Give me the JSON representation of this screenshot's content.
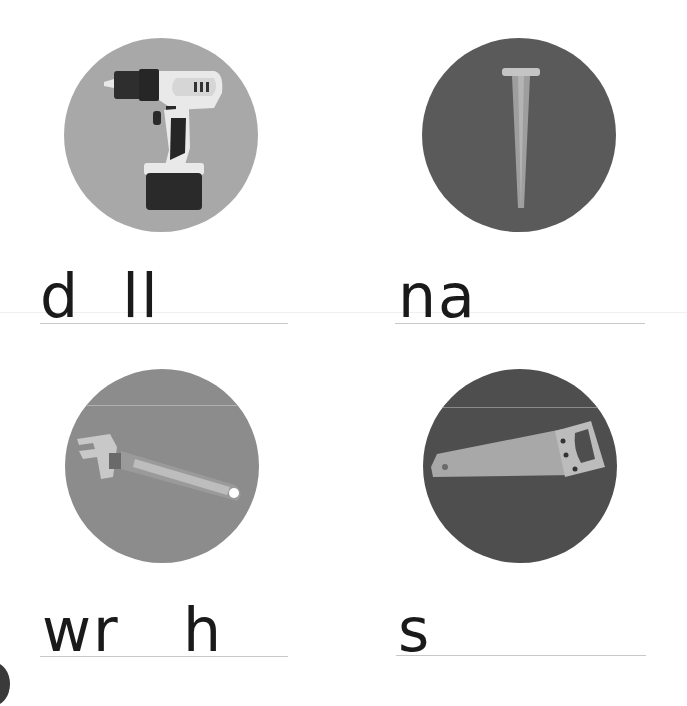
{
  "worksheet": {
    "items": [
      {
        "picture": "drill-icon",
        "partial_word": "d  ll",
        "answer_blank": true,
        "circle_color": "#a8a8a8"
      },
      {
        "picture": "nail-icon",
        "partial_word": "na",
        "answer_blank": true,
        "circle_color": "#5a5a5a"
      },
      {
        "picture": "wrench-icon",
        "partial_word": "wr   h",
        "answer_blank": true,
        "circle_color": "#8c8c8c"
      },
      {
        "picture": "saw-icon",
        "partial_word": "s",
        "answer_blank": true,
        "circle_color": "#4e4e4e"
      }
    ]
  }
}
